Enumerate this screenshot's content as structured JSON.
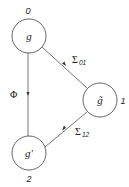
{
  "diagram": {
    "colors": {
      "stroke": "#555555",
      "text": "#222222",
      "background": "#ffffff"
    },
    "nodes": [
      {
        "id": "g",
        "label": "g",
        "index": "0",
        "cx": 29,
        "cy": 36,
        "r": 17
      },
      {
        "id": "g_tilde",
        "label": "g̃",
        "index": "1",
        "cx": 100,
        "cy": 100,
        "r": 17
      },
      {
        "id": "g_prime",
        "label": "g'",
        "index": "2",
        "cx": 29,
        "cy": 153,
        "r": 17
      }
    ],
    "edges": [
      {
        "from": "g",
        "to": "g_prime",
        "label": "Φ",
        "subscript": ""
      },
      {
        "from": "g",
        "to": "g_tilde",
        "label": "Σ",
        "subscript": "01"
      },
      {
        "from": "g_tilde",
        "to": "g_prime",
        "label": "Σ",
        "subscript": "12"
      }
    ]
  }
}
